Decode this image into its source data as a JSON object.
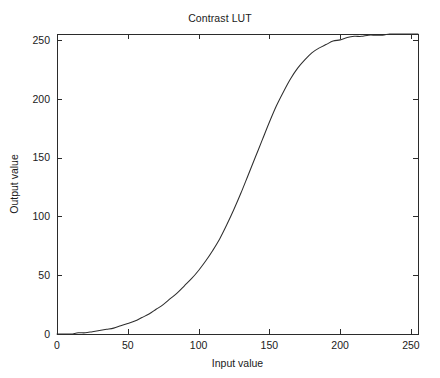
{
  "chart_data": {
    "type": "line",
    "title": "Contrast LUT",
    "xlabel": "Input value",
    "ylabel": "Output value",
    "xlim": [
      0,
      255
    ],
    "ylim": [
      0,
      255
    ],
    "grid": false,
    "legend": null,
    "line_color": "#2e2e2e",
    "background_color": "#ffffff",
    "axis_color": "#2b2b2b",
    "xticks": [
      0,
      50,
      100,
      150,
      200,
      250
    ],
    "yticks": [
      0,
      50,
      100,
      150,
      200,
      250
    ],
    "xtick_labels": [
      "0",
      "50",
      "100",
      "150",
      "200",
      "250"
    ],
    "ytick_labels": [
      "0",
      "50",
      "100",
      "150",
      "200",
      "250"
    ],
    "series": [
      {
        "name": "Contrast LUT",
        "x": [
          0,
          5,
          10,
          15,
          20,
          25,
          30,
          35,
          40,
          45,
          50,
          55,
          60,
          65,
          70,
          75,
          80,
          85,
          90,
          95,
          100,
          105,
          110,
          115,
          120,
          125,
          130,
          135,
          140,
          145,
          150,
          155,
          160,
          165,
          170,
          175,
          180,
          185,
          190,
          195,
          200,
          205,
          210,
          215,
          220,
          225,
          230,
          235,
          240,
          245,
          250,
          255
        ],
        "y": [
          0,
          0,
          0,
          1,
          1,
          2,
          3,
          4,
          5,
          7,
          9,
          11,
          14,
          17,
          21,
          25,
          30,
          35,
          41,
          47,
          54,
          62,
          71,
          81,
          93,
          106,
          120,
          135,
          150,
          165,
          180,
          194,
          206,
          217,
          226,
          233,
          239,
          243,
          246,
          249,
          250,
          252,
          253,
          253,
          254,
          254,
          254,
          255,
          255,
          255,
          255,
          255
        ]
      }
    ]
  },
  "layout": {
    "plot_left": 57,
    "plot_right": 418,
    "plot_top": 34,
    "plot_bottom": 334
  }
}
